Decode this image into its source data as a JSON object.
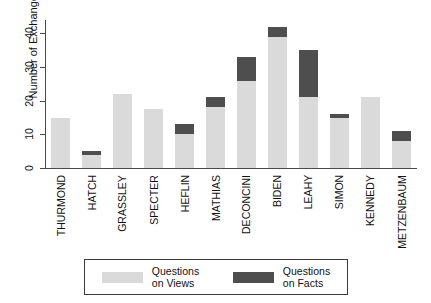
{
  "chart_data": {
    "type": "bar",
    "subtype": "stacked-bar",
    "title": "",
    "xlabel": "",
    "ylabel": "Number of Exchanges",
    "ylim": [
      0,
      44
    ],
    "yticks": [
      0,
      10,
      20,
      30,
      40
    ],
    "grid": false,
    "legend_position": "bottom",
    "categories": [
      "THURMOND",
      "HATCH",
      "GRASSLEY",
      "SPECTER",
      "HEFLIN",
      "MATHIAS",
      "DECONCINI",
      "BIDEN",
      "LEAHY",
      "SIMON",
      "KENNEDY",
      "METZENBAUM"
    ],
    "series": [
      {
        "name": "Questions on Views",
        "color": "#dadada",
        "values": [
          15,
          4,
          22,
          17.5,
          10,
          18,
          26,
          39,
          21,
          15,
          21,
          8
        ]
      },
      {
        "name": "Questions on Facts",
        "color": "#4e4e4e",
        "values": [
          0,
          1,
          0,
          0,
          3,
          3,
          7,
          3,
          14,
          1,
          0,
          3
        ]
      }
    ],
    "totals": [
      15,
      5,
      22,
      17.5,
      13,
      21,
      33,
      42,
      35,
      16,
      21,
      11
    ]
  },
  "axes": {
    "y_title": "Number of Exchanges",
    "y_tick_labels": [
      "0",
      "10",
      "20",
      "30",
      "40"
    ]
  },
  "legend": {
    "items": [
      {
        "label_line1": "Questions",
        "label_line2": "on Views",
        "swatch": "light-gray-swatch"
      },
      {
        "label_line1": "Questions",
        "label_line2": "on Facts",
        "swatch": "dark-gray-swatch"
      }
    ]
  },
  "colors": {
    "views": "#dadada",
    "facts": "#4e4e4e",
    "axis": "#4a4a4a",
    "text": "#111111",
    "background": "#ffffff"
  }
}
